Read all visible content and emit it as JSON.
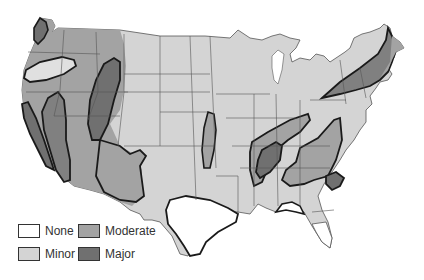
{
  "map": {
    "type": "choropleth-risk-zones",
    "region": "Contiguous United States",
    "colors": {
      "none": "#ffffff",
      "minor": "#d4d4d4",
      "moderate": "#a3a3a3",
      "major": "#707070",
      "state_border": "#555555",
      "zone_outline": "#1a1a1a"
    },
    "zones": [
      {
        "area": "Pacific Northwest coast (WA)",
        "level": "Major"
      },
      {
        "area": "Oregon interior",
        "level": "Minor"
      },
      {
        "area": "California coast",
        "level": "Major"
      },
      {
        "area": "Sierra Nevada / eastern CA",
        "level": "Major"
      },
      {
        "area": "Idaho / Utah / western Wyoming",
        "level": "Major"
      },
      {
        "area": "Southwest (AZ, NM)",
        "level": "Moderate"
      },
      {
        "area": "Kansas / Oklahoma strip",
        "level": "Moderate"
      },
      {
        "area": "New Madrid (MO/AR/TN/KY)",
        "level": "Major"
      },
      {
        "area": "Ohio Valley / Appalachians",
        "level": "Moderate"
      },
      {
        "area": "South Carolina coast",
        "level": "Major"
      },
      {
        "area": "New England",
        "level": "Major"
      },
      {
        "area": "Texas",
        "level": "None"
      },
      {
        "area": "Florida peninsula",
        "level": "None"
      },
      {
        "area": "Gulf coast (AL/FL panhandle)",
        "level": "None"
      }
    ]
  },
  "legend": {
    "items": [
      {
        "label": "None",
        "color": "#ffffff"
      },
      {
        "label": "Moderate",
        "color": "#a3a3a3"
      },
      {
        "label": "Minor",
        "color": "#d4d4d4"
      },
      {
        "label": "Major",
        "color": "#707070"
      }
    ]
  }
}
